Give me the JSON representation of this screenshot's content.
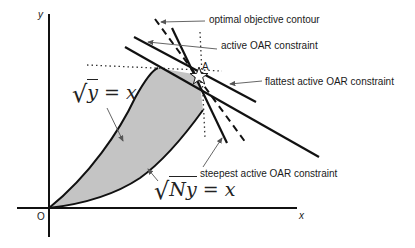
{
  "diagram": {
    "axes": {
      "x_label": "x",
      "y_label": "y",
      "origin_label": "O"
    },
    "curves": {
      "upper": {
        "lhs_radicand": "y",
        "rhs": "x",
        "equals": "="
      },
      "lower": {
        "lhs_radicand": "Ny",
        "rhs": "x",
        "equals": "="
      }
    },
    "point": {
      "label": "A",
      "marker": "star-icon"
    },
    "annotations": {
      "optimal_contour": "optimal objective contour",
      "active_constraint": "active OAR constraint",
      "flattest_constraint": "flattest active OAR constraint",
      "steepest_constraint": "steepest active OAR constraint"
    },
    "colors": {
      "feasible_region_fill": "#c4c4c4",
      "line": "#111111",
      "arrow": "#555555",
      "background": "#ffffff"
    }
  }
}
